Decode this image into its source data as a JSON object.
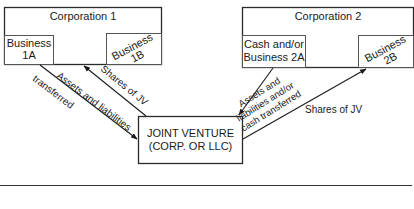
{
  "diagram": {
    "corporation1": {
      "title": "Corporation 1",
      "business_a": [
        "Business",
        "1A"
      ],
      "business_b": [
        "Business",
        "1B"
      ]
    },
    "corporation2": {
      "title": "Corporation 2",
      "business_a": [
        "Cash and/or",
        "Business 2A"
      ],
      "business_b": [
        "Business",
        "2B"
      ]
    },
    "joint_venture": {
      "lines": [
        "JOINT VENTURE",
        "(CORP. OR LLC)"
      ]
    },
    "arrows": {
      "corp1_to_jv": [
        "Assets and liabilities",
        "transferred"
      ],
      "jv_to_corp1": "Shares of JV",
      "corp2_to_jv": [
        "Assets and",
        "liabilities and/or",
        "cash transferred"
      ],
      "jv_to_corp2": "Shares of JV"
    }
  }
}
